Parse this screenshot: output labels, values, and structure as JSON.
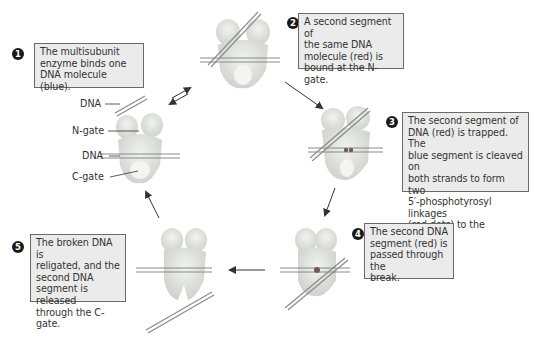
{
  "figure": {
    "steps": [
      {
        "number": "1",
        "text_lines": [
          "The multisubunit",
          "enzyme binds one",
          "DNA molecule (blue)."
        ]
      },
      {
        "number": "2",
        "text_lines": [
          "A second segment of",
          "the same DNA",
          "molecule (red) is",
          "bound at the N-gate."
        ]
      },
      {
        "number": "3",
        "text_lines": [
          "The second segment of",
          "DNA (red) is trapped. The",
          "blue segment is cleaved on",
          "both strands to form  two",
          "5′-phosphotyrosyl linkages",
          "(red dots) to the enzyme."
        ]
      },
      {
        "number": "4",
        "text_lines": [
          "The second DNA",
          "segment (red) is",
          "passed through the",
          "break."
        ]
      },
      {
        "number": "5",
        "text_lines": [
          "The broken DNA is",
          "religated, and the",
          "second DNA",
          "segment is released",
          "through the C-gate."
        ]
      }
    ],
    "labels": {
      "dna_top": "DNA",
      "n_gate": "N-gate",
      "dna_middle": "DNA",
      "c_gate": "C-gate"
    },
    "colors": {
      "enzyme": "#e4e7e2",
      "enzyme_shade": "#c9cdc6",
      "dna_strand": "#8a8a8a",
      "caption_bg": "#ebebeb",
      "caption_border": "#6a6a6a",
      "linkage_dot": "#7a5a5a",
      "arrow": "#333333"
    }
  }
}
